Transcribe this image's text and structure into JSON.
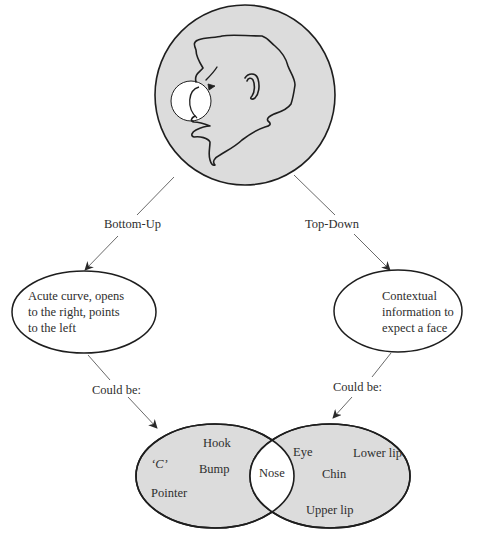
{
  "colors": {
    "fill": "#dcdcdc",
    "stroke": "#1e1e1e",
    "arrow": "#6a6a6a",
    "background": "#ffffff"
  },
  "face_circle": {
    "description": "Gray circle containing a line drawing of a face profile facing left; nose region highlighted with a white circle"
  },
  "branches": {
    "left": {
      "label": "Bottom-Up",
      "node_text": [
        "Acute curve, opens",
        "to the right, points",
        "to the left"
      ],
      "connector_label": "Could be:"
    },
    "right": {
      "label": "Top-Down",
      "node_text": [
        "Contextual",
        "information to",
        "expect a face"
      ],
      "connector_label": "Could be:"
    }
  },
  "venn": {
    "left_set": [
      "‘C’",
      "Hook",
      "Bump",
      "Pointer"
    ],
    "intersection": "Nose",
    "right_set": [
      "Eye",
      "Lower lip",
      "Chin",
      "Upper lip"
    ]
  }
}
